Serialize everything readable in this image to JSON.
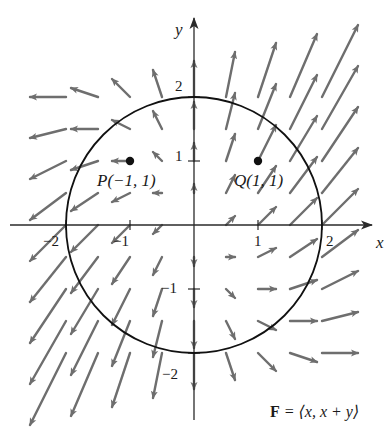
{
  "figure": {
    "field_label_bold": "F",
    "field_label_rest": " = ⟨x, x + y⟩",
    "axes": {
      "x_label": "x",
      "y_label": "y",
      "x_ticks": [
        {
          "value": -2,
          "label": "−2"
        },
        {
          "value": -1,
          "label": "−1"
        },
        {
          "value": 1,
          "label": "1"
        },
        {
          "value": 2,
          "label": "2"
        }
      ],
      "y_ticks": [
        {
          "value": 2,
          "label": "2"
        },
        {
          "value": 1,
          "label": "1"
        },
        {
          "value": -1,
          "label": "−1"
        },
        {
          "value": -2,
          "label": "−2"
        }
      ]
    },
    "points": [
      {
        "name": "P",
        "label": "P(−1, 1)",
        "x": -1,
        "y": 1
      },
      {
        "name": "Q",
        "label": "Q(1, 1)",
        "x": 1,
        "y": 1
      }
    ],
    "circle": {
      "cx": 0,
      "cy": 0,
      "r": 2
    },
    "colors": {
      "arrow": "#6e6e6e",
      "axis": "#2a2a2a",
      "circle": "#111111",
      "point": "#111111",
      "text": "#1a1a1a"
    }
  },
  "chart_data": {
    "type": "vector_field",
    "title": "F = ⟨x, x + y⟩",
    "field": {
      "u": "x",
      "v": "x + y"
    },
    "grid": {
      "x_min": -2,
      "x_max": 2,
      "y_min": -2,
      "y_max": 2,
      "step": 0.5
    },
    "arrow_scale_px_per_unit": 18,
    "xlabel": "x",
    "ylabel": "y",
    "xlim": [
      -3,
      3.1
    ],
    "ylim": [
      -3.2,
      3.5
    ],
    "annotations": [
      {
        "text": "P(−1, 1)",
        "x": -1,
        "y": 1
      },
      {
        "text": "Q(1, 1)",
        "x": 1,
        "y": 1
      }
    ],
    "curves": [
      {
        "type": "circle",
        "center": [
          0,
          0
        ],
        "radius": 2
      }
    ]
  },
  "layout": {
    "origin_px": [
      194,
      225
    ],
    "unit_px": 64
  }
}
